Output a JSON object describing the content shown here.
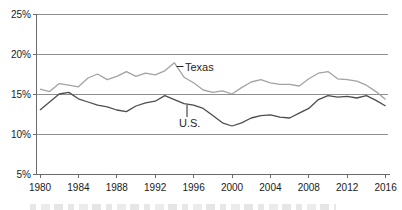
{
  "figure": {
    "type": "line-chart",
    "background": "#ffffff"
  },
  "chart_data": {
    "type": "line",
    "title": "",
    "xlabel": "",
    "ylabel": "",
    "xlim": [
      1980,
      2016
    ],
    "ylim": [
      5,
      25
    ],
    "grid": "horizontal",
    "legend": "inline-annotations",
    "x": [
      1980,
      1981,
      1982,
      1983,
      1984,
      1985,
      1986,
      1987,
      1988,
      1989,
      1990,
      1991,
      1992,
      1993,
      1994,
      1995,
      1996,
      1997,
      1998,
      1999,
      2000,
      2001,
      2002,
      2003,
      2004,
      2005,
      2006,
      2007,
      2008,
      2009,
      2010,
      2011,
      2012,
      2013,
      2014,
      2015,
      2016
    ],
    "series": [
      {
        "name": "Texas",
        "color": "#a3a3a3",
        "values": [
          15.6,
          15.3,
          16.3,
          16.1,
          15.9,
          17.0,
          17.5,
          16.8,
          17.2,
          17.8,
          17.2,
          17.6,
          17.4,
          17.9,
          18.9,
          17.1,
          16.4,
          15.5,
          15.2,
          15.4,
          15.0,
          15.8,
          16.5,
          16.8,
          16.4,
          16.2,
          16.2,
          16.0,
          16.9,
          17.6,
          17.8,
          16.9,
          16.8,
          16.6,
          16.1,
          15.3,
          14.3
        ]
      },
      {
        "name": "U.S.",
        "color": "#4d4d4d",
        "values": [
          13.0,
          14.0,
          15.0,
          15.2,
          14.4,
          14.0,
          13.6,
          13.4,
          13.0,
          12.8,
          13.5,
          13.9,
          14.1,
          14.8,
          14.3,
          13.8,
          13.6,
          13.2,
          12.3,
          11.4,
          11.0,
          11.4,
          12.0,
          12.3,
          12.4,
          12.1,
          12.0,
          12.6,
          13.2,
          14.3,
          14.8,
          14.6,
          14.7,
          14.5,
          14.8,
          14.2,
          13.5
        ]
      }
    ],
    "y_ticks": [
      {
        "value": 25,
        "label": "25%"
      },
      {
        "value": 20,
        "label": "20%"
      },
      {
        "value": 15,
        "label": "15%"
      },
      {
        "value": 10,
        "label": "10%"
      },
      {
        "value": 5,
        "label": "5%"
      }
    ],
    "x_tick_labels": [
      "1980",
      "1984",
      "1988",
      "1992",
      "1996",
      "2000",
      "2004",
      "2008",
      "2012",
      "2016"
    ],
    "annotations": [
      {
        "text": "Texas",
        "x": 185,
        "y": 71,
        "font_size": 11,
        "leader": {
          "x1": 176.5,
          "y1": 66.5,
          "x2": 183.5,
          "y2": 66.5
        }
      },
      {
        "text": "U.S.",
        "x": 179,
        "y": 127,
        "font_size": 11,
        "leader": {
          "x1": 187,
          "y1": 105,
          "x2": 187,
          "y2": 117
        }
      }
    ],
    "colors": {
      "grid": "#8f8f8f",
      "axis": "#6b6b6b",
      "tick_text": "#1a1a1a",
      "annotation_text": "#262626"
    }
  }
}
